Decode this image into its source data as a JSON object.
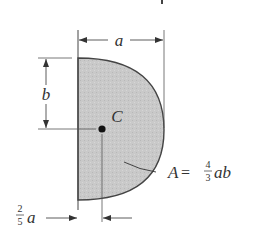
{
  "diagram": {
    "type": "centroid-figure",
    "shape": "semi-parabolic area (half parabola about vertical axis)",
    "fill_color": "#c8c8c8",
    "stroke_color": "#444444",
    "labels": {
      "width_dim": "a",
      "height_dim": "b",
      "centroid": "C",
      "area_lhs": "A",
      "area_eq": "=",
      "area_num": "4",
      "area_den": "3",
      "area_rhs": "ab",
      "offset_num": "2",
      "offset_den": "5",
      "offset_var": "a"
    },
    "top_fragment": "t"
  }
}
